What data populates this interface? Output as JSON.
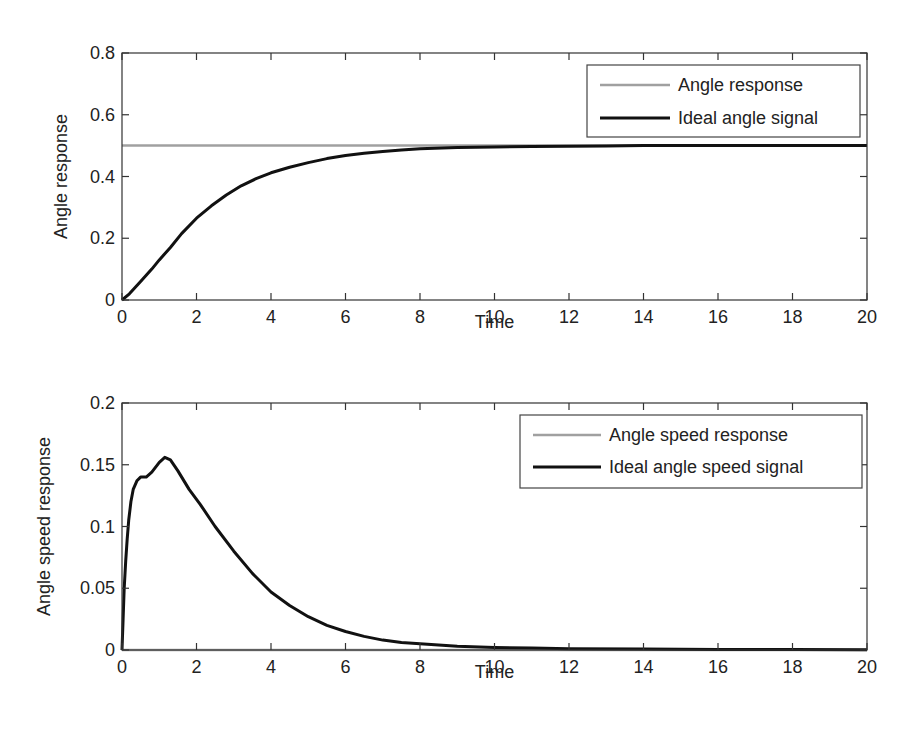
{
  "chart_data": [
    {
      "type": "line",
      "title": "",
      "xlabel": "Time",
      "ylabel": "Angle response",
      "xlim": [
        0,
        20
      ],
      "ylim": [
        0,
        0.8
      ],
      "xticks": [
        0,
        2,
        4,
        6,
        8,
        10,
        12,
        14,
        16,
        18,
        20
      ],
      "xtick_labels": [
        "0",
        "2",
        "4",
        "6",
        "8",
        "10",
        "12",
        "14",
        "16",
        "18",
        "20"
      ],
      "yticks": [
        0,
        0.2,
        0.4,
        0.6,
        0.8
      ],
      "ytick_labels": [
        "0",
        "0.2",
        "0.4",
        "0.6",
        "0.8"
      ],
      "grid": false,
      "legend_position": "upper right",
      "series": [
        {
          "name": "Angle response",
          "color": "#a0a0a0",
          "width": 2.5,
          "x": [
            0,
            20
          ],
          "values": [
            0.5,
            0.5
          ]
        },
        {
          "name": "Ideal angle signal",
          "color": "#111111",
          "width": 3,
          "x": [
            0,
            0.2,
            0.5,
            0.8,
            1.0,
            1.3,
            1.6,
            2.0,
            2.4,
            2.8,
            3.2,
            3.6,
            4.0,
            4.5,
            5.0,
            5.5,
            6.0,
            6.5,
            7.0,
            7.5,
            8.0,
            9.0,
            10.0,
            11.0,
            12.0,
            13.0,
            14.0,
            16.0,
            18.0,
            20.0
          ],
          "values": [
            0,
            0.02,
            0.06,
            0.1,
            0.13,
            0.17,
            0.215,
            0.265,
            0.305,
            0.34,
            0.37,
            0.393,
            0.412,
            0.43,
            0.445,
            0.458,
            0.468,
            0.475,
            0.481,
            0.486,
            0.49,
            0.494,
            0.496,
            0.497,
            0.498,
            0.499,
            0.5,
            0.5,
            0.5,
            0.5
          ]
        }
      ]
    },
    {
      "type": "line",
      "title": "",
      "xlabel": "Time",
      "ylabel": "Angle speed response",
      "xlim": [
        0,
        20
      ],
      "ylim": [
        0,
        0.2
      ],
      "xticks": [
        0,
        2,
        4,
        6,
        8,
        10,
        12,
        14,
        16,
        18,
        20
      ],
      "xtick_labels": [
        "0",
        "2",
        "4",
        "6",
        "8",
        "10",
        "12",
        "14",
        "16",
        "18",
        "20"
      ],
      "yticks": [
        0,
        0.05,
        0.1,
        0.15,
        0.2
      ],
      "ytick_labels": [
        "0",
        "0.05",
        "0.1",
        "0.15",
        "0.2"
      ],
      "grid": false,
      "legend_position": "upper right",
      "series": [
        {
          "name": "Angle speed response",
          "color": "#a0a0a0",
          "width": 2.5,
          "x": [
            0,
            20
          ],
          "values": [
            0,
            0
          ]
        },
        {
          "name": "Ideal angle speed signal",
          "color": "#111111",
          "width": 3,
          "x": [
            0,
            0.03,
            0.06,
            0.1,
            0.14,
            0.18,
            0.24,
            0.3,
            0.4,
            0.5,
            0.65,
            0.8,
            1.0,
            1.15,
            1.3,
            1.5,
            1.8,
            2.1,
            2.5,
            3.0,
            3.5,
            4.0,
            4.5,
            5.0,
            5.5,
            6.0,
            6.5,
            7.0,
            7.5,
            8.0,
            8.5,
            9.0,
            10.0,
            11.0,
            12.0,
            14.0,
            16.0,
            18.0,
            20.0
          ],
          "values": [
            0,
            0.025,
            0.05,
            0.072,
            0.09,
            0.105,
            0.12,
            0.13,
            0.137,
            0.14,
            0.14,
            0.144,
            0.152,
            0.156,
            0.154,
            0.145,
            0.13,
            0.118,
            0.1,
            0.08,
            0.062,
            0.047,
            0.036,
            0.027,
            0.02,
            0.015,
            0.011,
            0.008,
            0.006,
            0.005,
            0.004,
            0.003,
            0.002,
            0.0015,
            0.001,
            0.0007,
            0.0005,
            0.0003,
            0.0002
          ]
        }
      ]
    }
  ],
  "panels": [
    {
      "ylabel": "Angle response",
      "xlabel": "Time",
      "legend": [
        "Angle response",
        "Ideal angle signal"
      ]
    },
    {
      "ylabel": "Angle speed response",
      "xlabel": "Time",
      "legend": [
        "Angle speed response",
        "Ideal angle speed signal"
      ]
    }
  ]
}
